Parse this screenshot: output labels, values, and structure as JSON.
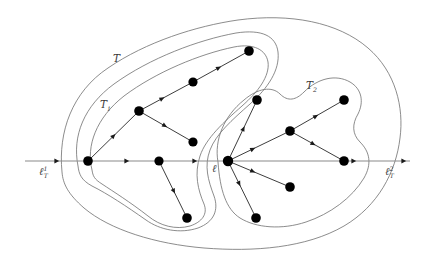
{
  "figure": {
    "kind": "mathematical-diagram",
    "background_color": "#ffffff",
    "curve_color": "#6f6f6f",
    "axis_color": "#8a8a8a",
    "node_color": "#000000",
    "edge_color": "#1a1a1a"
  },
  "labels": {
    "tree_outer": {
      "text": "T",
      "sub": "",
      "sup": "",
      "x": 113,
      "y": 62
    },
    "subtree_left": {
      "text": "T",
      "sub": "1",
      "sup": "",
      "x": 100,
      "y": 108
    },
    "subtree_right": {
      "text": "T",
      "sub": "2",
      "sup": "",
      "x": 306,
      "y": 89
    },
    "line_center": {
      "text": "ℓ",
      "sub": "",
      "sup": "",
      "x": 212,
      "y": 172
    },
    "line_left": {
      "text": "ℓ",
      "sub": "T",
      "sup": "1",
      "x": 39,
      "y": 175
    },
    "line_right": {
      "text": "ℓ",
      "sub": "T",
      "sup": "2",
      "x": 385,
      "y": 175
    }
  },
  "axis": {
    "y": 161,
    "x_start": 25,
    "x_end": 410,
    "arrow_marks": [
      {
        "x": 58,
        "y": 161
      },
      {
        "x": 128,
        "y": 161
      },
      {
        "x": 196,
        "y": 161
      },
      {
        "x": 355,
        "y": 161
      },
      {
        "x": 405,
        "y": 161
      }
    ]
  },
  "nodes": [
    {
      "id": "n-root",
      "x": 228,
      "y": 161,
      "r": 5.2,
      "tree": "center"
    },
    {
      "id": "l-hub",
      "x": 88,
      "y": 161,
      "r": 4.8,
      "tree": "T1"
    },
    {
      "id": "l-mid",
      "x": 159,
      "y": 161,
      "r": 4.6,
      "tree": "T1"
    },
    {
      "id": "l-up1",
      "x": 139,
      "y": 111,
      "r": 4.8,
      "tree": "T1"
    },
    {
      "id": "l-up2",
      "x": 193,
      "y": 82,
      "r": 4.6,
      "tree": "T1"
    },
    {
      "id": "l-up3",
      "x": 249,
      "y": 51,
      "r": 4.8,
      "tree": "T1"
    },
    {
      "id": "l-right",
      "x": 193,
      "y": 142,
      "r": 4.6,
      "tree": "T1"
    },
    {
      "id": "l-down",
      "x": 187,
      "y": 218,
      "r": 4.8,
      "tree": "T1"
    },
    {
      "id": "r-up",
      "x": 257,
      "y": 100,
      "r": 4.8,
      "tree": "T2"
    },
    {
      "id": "r-mid",
      "x": 290,
      "y": 131,
      "r": 4.8,
      "tree": "T2"
    },
    {
      "id": "r-far",
      "x": 344,
      "y": 100,
      "r": 4.8,
      "tree": "T2"
    },
    {
      "id": "r-axis",
      "x": 344,
      "y": 161,
      "r": 4.8,
      "tree": "T2"
    },
    {
      "id": "r-low1",
      "x": 290,
      "y": 187,
      "r": 4.8,
      "tree": "T2"
    },
    {
      "id": "r-low2",
      "x": 256,
      "y": 218,
      "r": 4.8,
      "tree": "T2"
    }
  ],
  "edges": [
    {
      "from": "l-hub",
      "to": "l-up1",
      "arrow_at": 0.52
    },
    {
      "from": "l-up1",
      "to": "l-up2",
      "arrow_at": 0.45
    },
    {
      "from": "l-up2",
      "to": "l-up3",
      "arrow_at": 0.48
    },
    {
      "from": "l-up1",
      "to": "l-right",
      "arrow_at": 0.5
    },
    {
      "from": "l-mid",
      "to": "l-down",
      "arrow_at": 0.55
    },
    {
      "from": "n-root",
      "to": "r-up",
      "arrow_at": 0.55
    },
    {
      "from": "n-root",
      "to": "r-mid",
      "arrow_at": 0.42
    },
    {
      "from": "r-mid",
      "to": "r-far",
      "arrow_at": 0.5
    },
    {
      "from": "r-mid",
      "to": "r-axis",
      "arrow_at": 0.45
    },
    {
      "from": "n-root",
      "to": "r-low1",
      "arrow_at": 0.42
    },
    {
      "from": "n-root",
      "to": "r-low2",
      "arrow_at": 0.42
    }
  ],
  "regions": [
    {
      "id": "outer-T",
      "name": "outer-boundary-T",
      "path": "M 62 172 C 58 132 72 92 108 68 C 146 42 196 26 238 20 C 290 13 338 22 368 48 C 396 72 404 108 400 138 C 396 172 378 206 344 226 C 306 248 254 252 204 248 C 156 244 110 230 84 208 C 68 194 63 184 62 172 Z"
    },
    {
      "id": "region-T1",
      "name": "subtree-boundary-T1",
      "path": "M 78 166 C 72 136 84 106 114 84 C 150 58 198 40 236 33 C 262 29 276 36 278 52 C 280 70 268 88 250 104 C 232 120 216 134 210 150 C 204 166 208 180 214 196 C 219 210 214 222 198 228 C 180 234 160 230 146 220 C 126 206 108 194 92 186 C 81 180 79 174 78 166 Z"
    },
    {
      "id": "region-T2",
      "name": "subtree-boundary-T2",
      "path": "M 218 162 C 214 140 224 116 244 100 C 258 88 272 86 280 94 C 288 102 296 100 304 92 C 318 78 336 74 350 82 C 362 89 364 102 358 114 C 352 124 352 134 360 142 C 370 152 372 164 364 178 C 352 198 330 214 306 222 C 282 230 256 228 240 218 C 226 209 220 190 218 162 Z"
    },
    {
      "id": "region-T1-inner",
      "name": "subtree-inner-contour-T1",
      "path": "M 92 170 C 86 146 96 118 124 96 C 156 72 200 54 234 47 C 254 43 266 50 268 62 C 270 76 258 92 242 106 C 224 122 206 138 200 156 C 194 174 198 190 204 204 C 208 214 202 222 190 226 C 176 230 160 226 148 216 C 130 202 114 192 102 184 C 94 179 93 176 92 170 Z"
    }
  ]
}
